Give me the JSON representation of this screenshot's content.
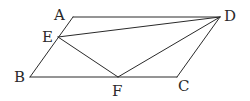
{
  "diagram": {
    "type": "geometry-figure",
    "points": [
      "A",
      "B",
      "C",
      "D",
      "E",
      "F"
    ],
    "labels": {
      "A": "A",
      "B": "B",
      "C": "C",
      "D": "D",
      "E": "E",
      "F": "F"
    },
    "segments": [
      {
        "from": "A",
        "to": "D"
      },
      {
        "from": "D",
        "to": "C"
      },
      {
        "from": "C",
        "to": "B"
      },
      {
        "from": "B",
        "to": "A"
      },
      {
        "from": "E",
        "to": "D"
      },
      {
        "from": "E",
        "to": "F"
      },
      {
        "from": "F",
        "to": "D"
      }
    ],
    "stroke_color": "#2a2a2a"
  }
}
